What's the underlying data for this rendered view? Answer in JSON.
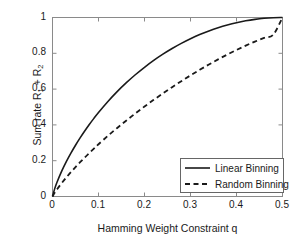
{
  "chart_data": {
    "type": "line",
    "title": "",
    "xlabel": "Hamming Weight Constraint q",
    "ylabel": "Sum rate R1 + R2",
    "ylabel_parts": {
      "prefix": "Sum rate R",
      "sub1": "1",
      "mid": " + R",
      "sub2": "2"
    },
    "xlim": [
      0,
      0.5
    ],
    "ylim": [
      0,
      1
    ],
    "grid": false,
    "legend_position": "lower right",
    "xticks": [
      0,
      0.1,
      0.2,
      0.3,
      0.4,
      0.5
    ],
    "xtick_labels": [
      "0",
      "0.1",
      "0.2",
      "0.3",
      "0.4",
      "0.5"
    ],
    "yticks": [
      0,
      0.2,
      0.4,
      0.6,
      0.8,
      1
    ],
    "ytick_labels": [
      "0",
      "0.2",
      "0.4",
      "0.6",
      "0.8",
      "1"
    ],
    "x": [
      0,
      0.005,
      0.01,
      0.02,
      0.03,
      0.04,
      0.05,
      0.06,
      0.07,
      0.08,
      0.09,
      0.1,
      0.12,
      0.14,
      0.16,
      0.18,
      0.2,
      0.22,
      0.24,
      0.26,
      0.28,
      0.3,
      0.32,
      0.34,
      0.36,
      0.38,
      0.4,
      0.42,
      0.44,
      0.46,
      0.48,
      0.5
    ],
    "series": [
      {
        "name": "Linear Binning",
        "style": "solid",
        "color": "#1a1a1a",
        "values": [
          0,
          0.0454,
          0.0808,
          0.1414,
          0.1944,
          0.2423,
          0.2864,
          0.3274,
          0.3659,
          0.4022,
          0.4365,
          0.469,
          0.5294,
          0.5842,
          0.6343,
          0.6801,
          0.7219,
          0.7602,
          0.795,
          0.8267,
          0.8555,
          0.8813,
          0.9044,
          0.9249,
          0.9427,
          0.958,
          0.971,
          0.9815,
          0.9896,
          0.9954,
          0.9988,
          1.0
        ]
      },
      {
        "name": "Random Binning",
        "style": "dashed",
        "color": "#1a1a1a",
        "values": [
          0,
          0.0217,
          0.0404,
          0.0746,
          0.1062,
          0.136,
          0.1644,
          0.1916,
          0.2178,
          0.2432,
          0.2678,
          0.2918,
          0.3378,
          0.3816,
          0.4235,
          0.4638,
          0.5026,
          0.54,
          0.576,
          0.6108,
          0.6443,
          0.6766,
          0.7076,
          0.7374,
          0.7659,
          0.793,
          0.8187,
          0.8429,
          0.8654,
          0.886,
          0.9043,
          1.0
        ]
      }
    ]
  },
  "legend": {
    "items": [
      {
        "label": "Linear Binning",
        "style": "solid"
      },
      {
        "label": "Random Binning",
        "style": "dashed"
      }
    ]
  },
  "axes": {
    "frame_color": "#808080",
    "tick_color": "#808080"
  }
}
